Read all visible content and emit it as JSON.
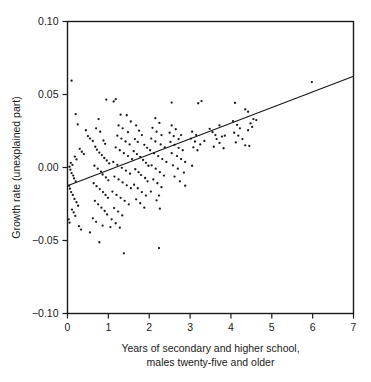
{
  "chart_data": {
    "type": "scatter",
    "title": "",
    "xlabel": "Years of secondary and higher school, males twenty-five and older",
    "xlabel_lines": [
      "Years of secondary and higher school,",
      "males twenty-five and older"
    ],
    "ylabel": "Growth rate (unexplained part)",
    "xlim": [
      0,
      7
    ],
    "ylim": [
      -0.1,
      0.1
    ],
    "xticks": [
      0,
      1,
      2,
      3,
      4,
      5,
      6,
      7
    ],
    "xtick_labels": [
      "0",
      "1",
      "2",
      "3",
      "4",
      "5",
      "6",
      "7"
    ],
    "yticks": [
      -0.1,
      -0.05,
      0.0,
      0.05,
      0.1
    ],
    "ytick_labels": [
      "-0.10",
      "-0.05",
      "0.00",
      "0.05",
      "0.10"
    ],
    "grid": false,
    "legend": false,
    "marker_color": "#1a1a1a",
    "line_color": "#1a1a1a",
    "frame_color": "#1a1a1a",
    "fit_line": {
      "name": "regression line",
      "x": [
        0,
        7
      ],
      "y": [
        -0.0125,
        0.0625
      ],
      "slope": 0.01071,
      "intercept": -0.0125
    },
    "points": [
      [
        0.1,
        0.0595
      ],
      [
        5.98,
        0.0585
      ],
      [
        0.2,
        0.0365
      ],
      [
        0.95,
        0.0465
      ],
      [
        1.18,
        0.0468
      ],
      [
        1.13,
        0.0452
      ],
      [
        2.55,
        0.0445
      ],
      [
        3.2,
        0.044
      ],
      [
        3.28,
        0.0455
      ],
      [
        4.1,
        0.0442
      ],
      [
        4.35,
        0.0398
      ],
      [
        4.42,
        0.0382
      ],
      [
        0.25,
        0.0295
      ],
      [
        0.45,
        0.0255
      ],
      [
        0.5,
        0.0215
      ],
      [
        0.55,
        0.0198
      ],
      [
        0.62,
        0.0182
      ],
      [
        0.3,
        0.0128
      ],
      [
        0.35,
        0.0108
      ],
      [
        0.4,
        0.0092
      ],
      [
        0.18,
        0.0075
      ],
      [
        0.22,
        0.0055
      ],
      [
        0.08,
        0.0032
      ],
      [
        0.12,
        0.0018
      ],
      [
        0.05,
        0.0005
      ],
      [
        0.07,
        -0.0015
      ],
      [
        0.1,
        -0.0038
      ],
      [
        0.14,
        -0.0055
      ],
      [
        0.16,
        -0.0075
      ],
      [
        0.2,
        -0.0095
      ],
      [
        0.04,
        -0.0125
      ],
      [
        0.06,
        -0.0145
      ],
      [
        0.09,
        -0.0168
      ],
      [
        0.13,
        -0.0188
      ],
      [
        0.17,
        -0.0215
      ],
      [
        0.22,
        -0.0238
      ],
      [
        0.26,
        -0.0262
      ],
      [
        0.11,
        -0.0288
      ],
      [
        0.15,
        -0.0308
      ],
      [
        0.19,
        -0.0332
      ],
      [
        0.03,
        -0.0355
      ],
      [
        0.05,
        -0.0378
      ],
      [
        0.28,
        -0.0402
      ],
      [
        0.33,
        -0.0425
      ],
      [
        0.76,
        0.0332
      ],
      [
        0.7,
        0.0268
      ],
      [
        0.8,
        0.0245
      ],
      [
        0.88,
        0.0185
      ],
      [
        0.92,
        0.0162
      ],
      [
        0.68,
        0.0142
      ],
      [
        0.72,
        0.0122
      ],
      [
        0.78,
        0.0102
      ],
      [
        0.84,
        0.0085
      ],
      [
        0.9,
        0.0065
      ],
      [
        0.96,
        0.0048
      ],
      [
        1.02,
        0.0028
      ],
      [
        0.66,
        0.0012
      ],
      [
        0.74,
        -0.0008
      ],
      [
        0.82,
        -0.0028
      ],
      [
        0.86,
        -0.0048
      ],
      [
        0.94,
        -0.0068
      ],
      [
        1.0,
        -0.0088
      ],
      [
        0.64,
        -0.0108
      ],
      [
        0.71,
        -0.0128
      ],
      [
        0.79,
        -0.0148
      ],
      [
        0.87,
        -0.0168
      ],
      [
        0.93,
        -0.0188
      ],
      [
        0.99,
        -0.0208
      ],
      [
        0.67,
        -0.0228
      ],
      [
        0.75,
        -0.0252
      ],
      [
        0.83,
        -0.0275
      ],
      [
        0.91,
        -0.0298
      ],
      [
        0.97,
        -0.0322
      ],
      [
        0.62,
        -0.0348
      ],
      [
        0.7,
        -0.0372
      ],
      [
        0.86,
        -0.0398
      ],
      [
        0.55,
        -0.0445
      ],
      [
        0.78,
        -0.0512
      ],
      [
        1.38,
        -0.0588
      ],
      [
        1.3,
        0.0362
      ],
      [
        1.45,
        0.0358
      ],
      [
        1.55,
        0.0315
      ],
      [
        1.25,
        0.0288
      ],
      [
        1.35,
        0.0268
      ],
      [
        1.48,
        0.0242
      ],
      [
        1.22,
        0.0218
      ],
      [
        1.32,
        0.0198
      ],
      [
        1.42,
        0.0178
      ],
      [
        1.52,
        0.0158
      ],
      [
        1.18,
        0.0138
      ],
      [
        1.28,
        0.0118
      ],
      [
        1.38,
        0.0098
      ],
      [
        1.48,
        0.0078
      ],
      [
        1.58,
        0.0058
      ],
      [
        1.12,
        0.0038
      ],
      [
        1.22,
        0.0018
      ],
      [
        1.33,
        -0.0002
      ],
      [
        1.43,
        -0.0022
      ],
      [
        1.53,
        -0.0042
      ],
      [
        1.15,
        -0.0062
      ],
      [
        1.25,
        -0.0082
      ],
      [
        1.35,
        -0.0102
      ],
      [
        1.45,
        -0.0122
      ],
      [
        1.55,
        -0.0142
      ],
      [
        1.1,
        -0.0165
      ],
      [
        1.2,
        -0.0188
      ],
      [
        1.3,
        -0.0208
      ],
      [
        1.4,
        -0.0228
      ],
      [
        1.5,
        -0.0252
      ],
      [
        1.14,
        -0.0278
      ],
      [
        1.24,
        -0.0302
      ],
      [
        1.34,
        -0.0328
      ],
      [
        1.08,
        -0.0355
      ],
      [
        1.18,
        -0.0382
      ],
      [
        1.05,
        -0.0408
      ],
      [
        1.28,
        -0.0412
      ],
      [
        1.68,
        0.0288
      ],
      [
        1.75,
        0.0252
      ],
      [
        1.82,
        0.0222
      ],
      [
        1.65,
        0.0195
      ],
      [
        1.72,
        0.0175
      ],
      [
        1.88,
        0.0155
      ],
      [
        1.95,
        0.0135
      ],
      [
        1.62,
        0.0112
      ],
      [
        1.7,
        0.0092
      ],
      [
        1.78,
        0.0072
      ],
      [
        1.85,
        0.0052
      ],
      [
        1.92,
        0.0032
      ],
      [
        1.98,
        0.0012
      ],
      [
        1.66,
        -0.0012
      ],
      [
        1.74,
        -0.0032
      ],
      [
        1.8,
        -0.0052
      ],
      [
        1.9,
        -0.0072
      ],
      [
        1.96,
        -0.0095
      ],
      [
        1.63,
        -0.0118
      ],
      [
        1.72,
        -0.0142
      ],
      [
        1.82,
        -0.0168
      ],
      [
        1.92,
        -0.0192
      ],
      [
        1.68,
        -0.0218
      ],
      [
        1.78,
        -0.0245
      ],
      [
        1.88,
        -0.0275
      ],
      [
        2.15,
        0.0338
      ],
      [
        2.25,
        0.0305
      ],
      [
        2.08,
        0.0272
      ],
      [
        2.18,
        0.0245
      ],
      [
        2.3,
        0.0222
      ],
      [
        2.05,
        0.0198
      ],
      [
        2.15,
        0.0178
      ],
      [
        2.28,
        0.0158
      ],
      [
        2.38,
        0.0138
      ],
      [
        2.02,
        0.0118
      ],
      [
        2.12,
        0.0098
      ],
      [
        2.22,
        0.0078
      ],
      [
        2.32,
        0.0058
      ],
      [
        2.42,
        0.0038
      ],
      [
        2.06,
        0.0015
      ],
      [
        2.16,
        -0.0008
      ],
      [
        2.26,
        -0.0032
      ],
      [
        2.36,
        -0.0055
      ],
      [
        2.1,
        -0.0082
      ],
      [
        2.2,
        -0.0108
      ],
      [
        2.3,
        -0.0135
      ],
      [
        2.04,
        -0.0165
      ],
      [
        2.24,
        -0.0192
      ],
      [
        2.18,
        -0.0225
      ],
      [
        2.26,
        -0.0282
      ],
      [
        2.24,
        -0.0552
      ],
      [
        2.55,
        0.0288
      ],
      [
        2.65,
        0.0262
      ],
      [
        2.5,
        0.0238
      ],
      [
        2.6,
        0.0215
      ],
      [
        2.72,
        0.0195
      ],
      [
        2.78,
        0.0222
      ],
      [
        2.52,
        0.0175
      ],
      [
        2.62,
        0.0155
      ],
      [
        2.72,
        0.0135
      ],
      [
        2.82,
        0.0118
      ],
      [
        2.55,
        0.0098
      ],
      [
        2.68,
        0.0078
      ],
      [
        2.78,
        0.0058
      ],
      [
        2.88,
        0.0038
      ],
      [
        2.58,
        0.0015
      ],
      [
        2.7,
        -0.0008
      ],
      [
        2.85,
        -0.0035
      ],
      [
        2.62,
        -0.0062
      ],
      [
        2.75,
        -0.0095
      ],
      [
        2.88,
        -0.0125
      ],
      [
        3.05,
        0.0245
      ],
      [
        3.15,
        0.0222
      ],
      [
        3.02,
        0.0198
      ],
      [
        3.12,
        0.0178
      ],
      [
        3.25,
        0.0158
      ],
      [
        3.08,
        0.0138
      ],
      [
        3.18,
        0.0118
      ],
      [
        3.05,
        0.0012
      ],
      [
        3.35,
        0.0182
      ],
      [
        3.48,
        0.0265
      ],
      [
        3.55,
        0.0242
      ],
      [
        3.62,
        0.0222
      ],
      [
        3.72,
        0.0288
      ],
      [
        3.78,
        0.0212
      ],
      [
        3.85,
        0.0218
      ],
      [
        3.65,
        0.0195
      ],
      [
        3.72,
        0.0168
      ],
      [
        3.58,
        0.0142
      ],
      [
        3.82,
        0.0132
      ],
      [
        4.05,
        0.0318
      ],
      [
        4.15,
        0.0292
      ],
      [
        4.22,
        0.0268
      ],
      [
        4.08,
        0.0238
      ],
      [
        4.18,
        0.0218
      ],
      [
        4.28,
        0.0195
      ],
      [
        4.12,
        0.0172
      ],
      [
        4.35,
        0.0152
      ],
      [
        4.45,
        0.0148
      ],
      [
        4.55,
        0.0332
      ],
      [
        4.62,
        0.0325
      ],
      [
        4.48,
        0.0302
      ],
      [
        4.52,
        0.0278
      ],
      [
        4.42,
        0.0255
      ]
    ]
  }
}
